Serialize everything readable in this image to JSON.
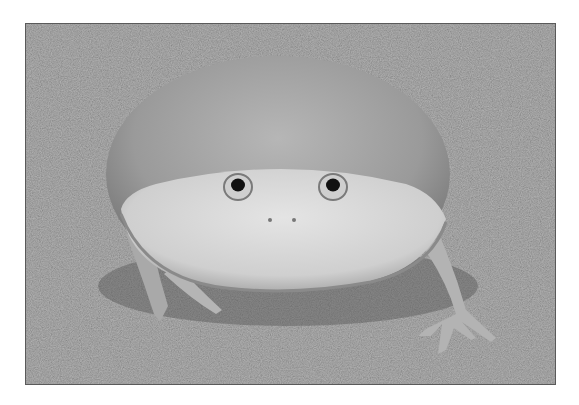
{
  "image": {
    "alt": "Grayscale photograph of a round, flat-faced frog sitting on sandy ground, facing the camera",
    "subject": "frog",
    "style": "black-and-white photo with white border",
    "colors": {
      "border": "#ffffff",
      "ground": "#7d7d7d",
      "frog_body": "#a8a8a8",
      "frog_belly": "#d9d9d9",
      "eye": "#111111"
    }
  }
}
